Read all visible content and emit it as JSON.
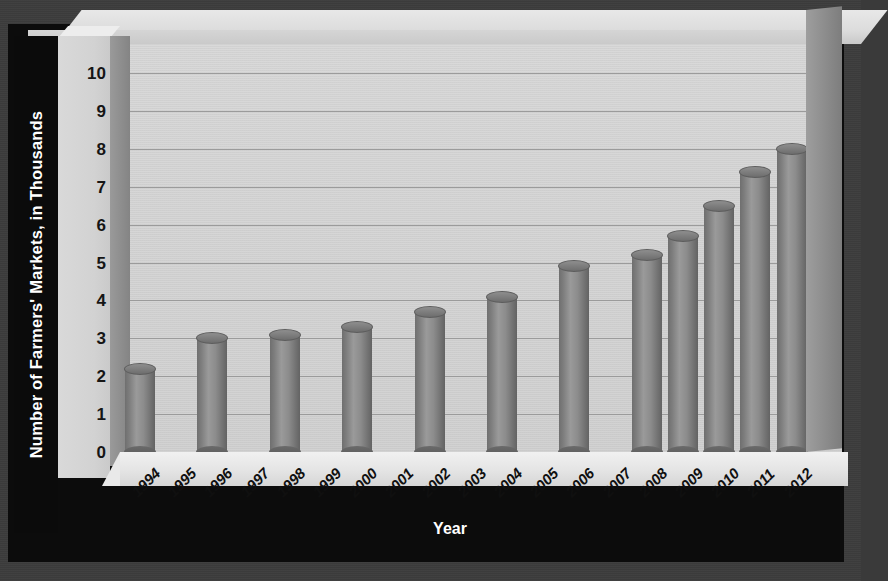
{
  "chart_data": {
    "type": "bar",
    "title": "",
    "xlabel": "Year",
    "ylabel": "Number of Farmers' Markets, in Thousands",
    "categories": [
      "1994",
      "1995",
      "1996",
      "1997",
      "1998",
      "1999",
      "2000",
      "2001",
      "2002",
      "2003",
      "2004",
      "2005",
      "2006",
      "2007",
      "2008",
      "2009",
      "2010",
      "2011",
      "2012"
    ],
    "values": [
      2.2,
      null,
      3.0,
      null,
      3.1,
      null,
      3.3,
      null,
      3.7,
      null,
      4.1,
      null,
      4.9,
      null,
      5.2,
      5.7,
      6.5,
      7.4,
      8.0
    ],
    "series": [
      {
        "name": "Number of Farmers' Markets",
        "points": [
          {
            "x": "1994",
            "y": 2.2
          },
          {
            "x": "1996",
            "y": 3.0
          },
          {
            "x": "1998",
            "y": 3.1
          },
          {
            "x": "2000",
            "y": 3.3
          },
          {
            "x": "2002",
            "y": 3.7
          },
          {
            "x": "2004",
            "y": 4.1
          },
          {
            "x": "2006",
            "y": 4.9
          },
          {
            "x": "2008",
            "y": 5.2
          },
          {
            "x": "2009",
            "y": 5.7
          },
          {
            "x": "2010",
            "y": 6.5
          },
          {
            "x": "2011",
            "y": 7.4
          },
          {
            "x": "2012",
            "y": 8.0
          }
        ]
      }
    ],
    "ytick_labels": [
      "10",
      "9",
      "8",
      "7",
      "6",
      "5",
      "4",
      "3",
      "2",
      "1",
      "0"
    ],
    "ylim": [
      0,
      10
    ],
    "ytick_step": 1,
    "grid": true,
    "legend": "none",
    "style_3d": true,
    "bar_shape": "cylinder",
    "colors": {
      "bar_fill": "#8a8a8a",
      "bar_shadow": "#656565",
      "plot_background": "#d5d5d5",
      "gridline": "#9b9b9b",
      "floor": "#e9e9e9",
      "frame_background": "#3c3c3c",
      "axis_title_band": "#0b0b0b",
      "axis_title_text": "#ffffff",
      "tick_text": "#131313"
    }
  },
  "axis": {
    "y_title": "Number of Farmers' Markets, in Thousands",
    "x_title": "Year"
  }
}
